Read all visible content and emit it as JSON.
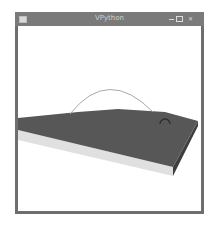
{
  "window": {
    "title": "VPython",
    "controls": {
      "minimize": "minimize",
      "maximize": "maximize",
      "close": "close"
    }
  },
  "scene": {
    "objects": [
      {
        "type": "box",
        "name": "slab",
        "top_color": "#555555",
        "front_color": "#e0e0e0",
        "side_color": "#4a4a4a"
      },
      {
        "type": "curve",
        "name": "trajectory-arc",
        "color": "#a8a8a8"
      },
      {
        "type": "ring",
        "name": "ball-marker",
        "color": "#2e2e2e"
      }
    ],
    "background": "#ffffff"
  },
  "colors": {
    "frame": "#6e6e6e",
    "titlebar": "#7a7a7a",
    "title_text": "#cfcfcf"
  }
}
